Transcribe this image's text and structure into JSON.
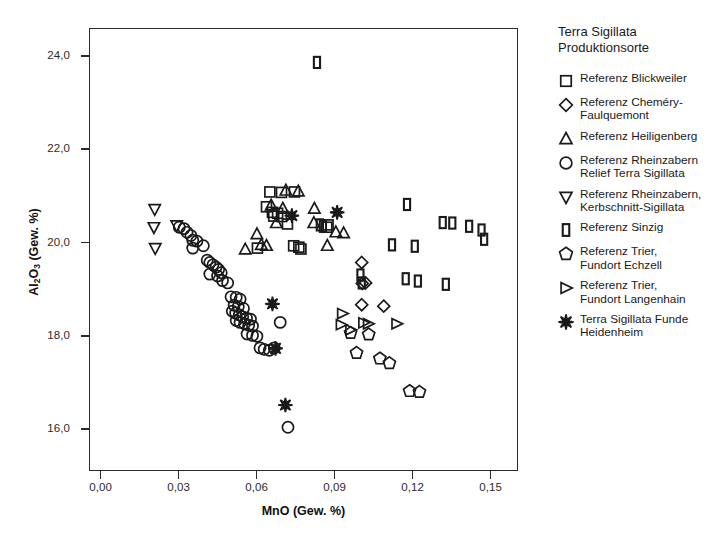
{
  "chart_data": {
    "type": "scatter",
    "title": "",
    "xlabel": "MnO (Gew. %)",
    "ylabel": "Al2O3 (Gew. %)",
    "ylabel_html": "Al<sub>2</sub>O<sub>3</sub> (Gew. %)",
    "xlim": [
      -0.0045,
      0.1605
    ],
    "ylim": [
      15.1,
      24.6
    ],
    "xticks": [
      0.0,
      0.03,
      0.06,
      0.09,
      0.12,
      0.15
    ],
    "xtick_labels": [
      "0,00",
      "0,03",
      "0,06",
      "0,09",
      "0,12",
      "0,15"
    ],
    "yticks": [
      16.0,
      18.0,
      20.0,
      22.0,
      24.0
    ],
    "ytick_labels": [
      "16,0",
      "18,0",
      "20,0",
      "22,0",
      "24,0"
    ],
    "grid": false,
    "legend_position": "right",
    "marker_color": "#1a1a1a",
    "series": [
      {
        "name": "Referenz Blickweiler",
        "marker": "square",
        "points": [
          [
            0.065,
            21.09
          ],
          [
            0.0695,
            21.08
          ],
          [
            0.0745,
            21.09
          ],
          [
            0.0637,
            20.77
          ],
          [
            0.066,
            20.65
          ],
          [
            0.068,
            20.63
          ],
          [
            0.0665,
            20.57
          ],
          [
            0.0695,
            20.56
          ],
          [
            0.0718,
            20.4
          ],
          [
            0.0875,
            20.38
          ],
          [
            0.087,
            20.33
          ],
          [
            0.0602,
            19.88
          ],
          [
            0.0742,
            19.93
          ],
          [
            0.0762,
            19.9
          ],
          [
            0.077,
            19.86
          ]
        ]
      },
      {
        "name": "Referenz Chemery-Faulquemont",
        "marker": "diamond",
        "points": [
          [
            0.1005,
            19.57
          ],
          [
            0.102,
            19.13
          ],
          [
            0.1007,
            19.12
          ],
          [
            0.1005,
            18.66
          ],
          [
            0.109,
            18.63
          ]
        ]
      },
      {
        "name": "Referenz Heiligenberg",
        "marker": "triangle-up",
        "points": [
          [
            0.0712,
            21.12
          ],
          [
            0.076,
            21.1
          ],
          [
            0.0655,
            20.8
          ],
          [
            0.07,
            20.73
          ],
          [
            0.0822,
            20.73
          ],
          [
            0.082,
            20.42
          ],
          [
            0.0675,
            20.42
          ],
          [
            0.06,
            20.18
          ],
          [
            0.0617,
            19.95
          ],
          [
            0.0637,
            19.93
          ],
          [
            0.0555,
            19.85
          ],
          [
            0.0905,
            20.22
          ],
          [
            0.0935,
            20.2
          ],
          [
            0.0872,
            19.93
          ]
        ]
      },
      {
        "name": "Referenz Rheinzabern Relief Terra Sigillata",
        "marker": "circle",
        "points": [
          [
            0.03,
            20.33
          ],
          [
            0.0318,
            20.3
          ],
          [
            0.033,
            20.22
          ],
          [
            0.0345,
            20.15
          ],
          [
            0.0352,
            20.05
          ],
          [
            0.0368,
            20.03
          ],
          [
            0.0352,
            19.88
          ],
          [
            0.0393,
            19.93
          ],
          [
            0.0408,
            19.62
          ],
          [
            0.0418,
            19.57
          ],
          [
            0.043,
            19.52
          ],
          [
            0.0442,
            19.47
          ],
          [
            0.0452,
            19.42
          ],
          [
            0.0462,
            19.35
          ],
          [
            0.0448,
            19.28
          ],
          [
            0.0418,
            19.32
          ],
          [
            0.0467,
            19.18
          ],
          [
            0.0487,
            19.13
          ],
          [
            0.05,
            18.83
          ],
          [
            0.052,
            18.82
          ],
          [
            0.0535,
            18.78
          ],
          [
            0.0512,
            18.65
          ],
          [
            0.0528,
            18.62
          ],
          [
            0.0548,
            18.58
          ],
          [
            0.0505,
            18.52
          ],
          [
            0.0518,
            18.48
          ],
          [
            0.0532,
            18.44
          ],
          [
            0.0545,
            18.4
          ],
          [
            0.056,
            18.37
          ],
          [
            0.0575,
            18.35
          ],
          [
            0.052,
            18.32
          ],
          [
            0.0535,
            18.28
          ],
          [
            0.0552,
            18.25
          ],
          [
            0.0568,
            18.22
          ],
          [
            0.0583,
            18.2
          ],
          [
            0.0562,
            18.03
          ],
          [
            0.0583,
            18.0
          ],
          [
            0.06,
            17.98
          ],
          [
            0.069,
            18.28
          ],
          [
            0.0612,
            17.73
          ],
          [
            0.0628,
            17.7
          ],
          [
            0.0648,
            17.68
          ],
          [
            0.0667,
            17.73
          ],
          [
            0.072,
            16.02
          ]
        ]
      },
      {
        "name": "Referenz Rheinzabern, Kerbschnitt-Sigillata",
        "marker": "triangle-down",
        "points": [
          [
            0.0205,
            20.72
          ],
          [
            0.0202,
            20.33
          ],
          [
            0.029,
            20.37
          ],
          [
            0.0207,
            19.88
          ]
        ]
      },
      {
        "name": "Referenz Sinzig",
        "marker": "sinzig",
        "points": [
          [
            0.0832,
            23.88
          ],
          [
            0.118,
            20.82
          ],
          [
            0.1318,
            20.43
          ],
          [
            0.1355,
            20.42
          ],
          [
            0.142,
            20.35
          ],
          [
            0.1468,
            20.27
          ],
          [
            0.1478,
            20.07
          ],
          [
            0.0855,
            20.35
          ],
          [
            0.1122,
            19.95
          ],
          [
            0.121,
            19.92
          ],
          [
            0.1,
            19.3
          ],
          [
            0.1175,
            19.22
          ],
          [
            0.1222,
            19.17
          ],
          [
            0.1005,
            19.13
          ],
          [
            0.133,
            19.1
          ],
          [
            0.0843,
            20.38
          ]
        ]
      },
      {
        "name": "Referenz Trier, Fundort Echzell",
        "marker": "pentagon",
        "points": [
          [
            0.0962,
            18.05
          ],
          [
            0.1032,
            18.02
          ],
          [
            0.0985,
            17.62
          ],
          [
            0.1075,
            17.5
          ],
          [
            0.1112,
            17.4
          ],
          [
            0.119,
            16.8
          ],
          [
            0.1228,
            16.78
          ]
        ]
      },
      {
        "name": "Referenz Trier, Fundort Langenhain",
        "marker": "triangle-right",
        "points": [
          [
            0.093,
            18.47
          ],
          [
            0.0925,
            18.23
          ],
          [
            0.1012,
            18.27
          ],
          [
            0.103,
            18.25
          ],
          [
            0.114,
            18.25
          ],
          [
            0.0962,
            18.12
          ]
        ]
      },
      {
        "name": "Terra Sigillata Funde Heidenheim",
        "marker": "star",
        "points": [
          [
            0.091,
            20.65
          ],
          [
            0.0735,
            20.58
          ],
          [
            0.066,
            18.68
          ],
          [
            0.0672,
            17.72
          ],
          [
            0.071,
            16.5
          ]
        ]
      }
    ]
  },
  "legend": {
    "title_line1": "Terra Sigillata",
    "title_line2": "Produktionsorte",
    "items": [
      {
        "marker": "square",
        "lines": [
          "Referenz Blickweiler"
        ]
      },
      {
        "marker": "diamond",
        "lines": [
          "Referenz Cheméry-",
          "Faulquemont"
        ]
      },
      {
        "marker": "triangle-up",
        "lines": [
          "Referenz Heiligenberg"
        ]
      },
      {
        "marker": "circle",
        "lines": [
          "Referenz Rheinzabern",
          "Relief Terra Sigillata"
        ]
      },
      {
        "marker": "triangle-down",
        "lines": [
          "Referenz Rheinzabern,",
          "Kerbschnitt-Sigillata"
        ]
      },
      {
        "marker": "sinzig",
        "lines": [
          "Referenz Sinzig"
        ]
      },
      {
        "marker": "pentagon",
        "lines": [
          "Referenz Trier,",
          "Fundort Echzell"
        ]
      },
      {
        "marker": "triangle-right",
        "lines": [
          "Referenz Trier,",
          "Fundort Langenhain"
        ]
      },
      {
        "marker": "star",
        "lines": [
          "Terra Sigillata Funde",
          "Heidenheim"
        ]
      }
    ]
  }
}
